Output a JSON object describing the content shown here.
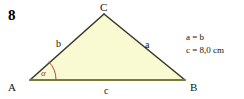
{
  "figure": {
    "exercise_number": "8",
    "triangle": {
      "fill_color": "#FAFAD2",
      "edge_color": "#3b3a2a",
      "base_edge_color": "#7a7a3c",
      "vertices": [
        {
          "name": "A",
          "label": "A",
          "x": 30,
          "y": 80
        },
        {
          "name": "B",
          "label": "B",
          "x": 185,
          "y": 80
        },
        {
          "name": "C",
          "label": "C",
          "x": 104,
          "y": 14
        }
      ],
      "vertex_label_positions": [
        {
          "label": "A",
          "x": 8,
          "y": 91
        },
        {
          "label": "B",
          "x": 190,
          "y": 91
        },
        {
          "label": "C",
          "x": 100,
          "y": 11
        }
      ],
      "side_labels": [
        {
          "name": "b",
          "label": "b",
          "x": 56,
          "y": 47,
          "side": "AC"
        },
        {
          "name": "a",
          "label": "a",
          "x": 145,
          "y": 48,
          "side": "CB"
        },
        {
          "name": "c",
          "label": "c",
          "x": 104,
          "y": 94,
          "side": "AB"
        }
      ],
      "angle_marking": {
        "name": "alpha",
        "label": "α",
        "at_vertex": "A",
        "color": "#b54a4a",
        "label_x": 41,
        "label_y": 76,
        "radius": 26
      }
    },
    "given_conditions": {
      "lines": [
        "a = b",
        "c = 8,0 cm"
      ],
      "x": 186,
      "line1_y": 40,
      "line2_y": 53
    }
  }
}
